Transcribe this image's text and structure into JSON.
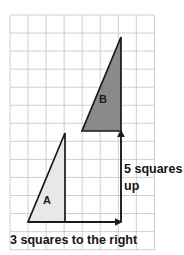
{
  "figure": {
    "background_color": "#ffffff",
    "grid": {
      "line_color": "#c9c9d4",
      "border_color": "#bfbfcc",
      "columns": 8,
      "rows": 13,
      "cell_size_px": 18.05,
      "origin_x": 10,
      "origin_y": 15
    },
    "shapes": [
      {
        "name": "triangle-a",
        "label": "A",
        "fill_color": "#e8e8e8",
        "stroke_color": "#1a1a1a",
        "points": "28,222 65,222 65,133",
        "label_x": 47,
        "label_y": 204
      },
      {
        "name": "triangle-b",
        "label": "B",
        "fill_color": "#8a8a8a",
        "stroke_color": "#1a1a1a",
        "points": "82,131 121,131 121,37",
        "label_x": 103,
        "label_y": 103
      }
    ],
    "arrows": [
      {
        "name": "horizontal-translation-arrow",
        "label": "3 squares to the right",
        "direction": "right",
        "squares": 3,
        "color": "#1a1a1a",
        "x1": 28,
        "y1": 222,
        "x2": 121,
        "y2": 222
      },
      {
        "name": "vertical-translation-arrow",
        "label_line_1": "5 squares",
        "label_line_2": "up",
        "direction": "up",
        "squares": 5,
        "color": "#1a1a1a",
        "x1": 121,
        "y1": 222,
        "x2": 121,
        "y2": 131
      }
    ],
    "captions": {
      "horizontal": "3 squares to the right",
      "vertical_line_1": "5 squares",
      "vertical_line_2": "up",
      "horizontal_x": 10,
      "horizontal_y": 244,
      "vertical_x": 124,
      "vertical_y_line_1": 173,
      "vertical_y_line_2": 190
    }
  }
}
